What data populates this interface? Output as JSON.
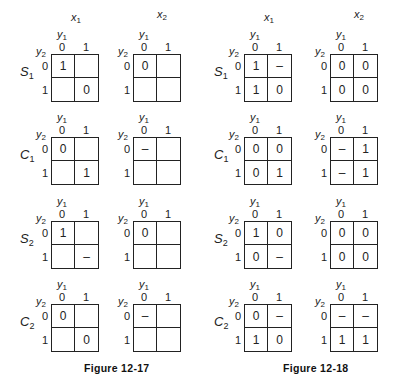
{
  "figures": [
    {
      "caption": "Figure 12-17",
      "column_headers": [
        {
          "var": "x",
          "sub": "1"
        },
        {
          "var": "x",
          "sub": "2"
        }
      ],
      "axis": {
        "col_var": "y",
        "col_sub": "1",
        "row_var": "y",
        "row_sub": "2",
        "col_values": [
          "0",
          "1"
        ],
        "row_values": [
          "0",
          "1"
        ]
      },
      "rows": [
        {
          "label": {
            "var": "S",
            "sub": "1"
          },
          "maps": [
            {
              "cells": [
                [
                  "1",
                  ""
                ],
                [
                  "",
                  "0"
                ]
              ]
            },
            {
              "cells": [
                [
                  "0",
                  ""
                ],
                [
                  "",
                  ""
                ]
              ]
            }
          ]
        },
        {
          "label": {
            "var": "C",
            "sub": "1"
          },
          "maps": [
            {
              "cells": [
                [
                  "0",
                  ""
                ],
                [
                  "",
                  "1"
                ]
              ]
            },
            {
              "cells": [
                [
                  "–",
                  ""
                ],
                [
                  "",
                  ""
                ]
              ]
            }
          ]
        },
        {
          "label": {
            "var": "S",
            "sub": "2"
          },
          "maps": [
            {
              "cells": [
                [
                  "1",
                  ""
                ],
                [
                  "",
                  "–"
                ]
              ]
            },
            {
              "cells": [
                [
                  "0",
                  ""
                ],
                [
                  "",
                  ""
                ]
              ]
            }
          ]
        },
        {
          "label": {
            "var": "C",
            "sub": "2"
          },
          "maps": [
            {
              "cells": [
                [
                  "0",
                  ""
                ],
                [
                  "",
                  "0"
                ]
              ]
            },
            {
              "cells": [
                [
                  "–",
                  ""
                ],
                [
                  "",
                  ""
                ]
              ]
            }
          ]
        }
      ]
    },
    {
      "caption": "Figure 12-18",
      "column_headers": [
        {
          "var": "x",
          "sub": "1"
        },
        {
          "var": "x",
          "sub": "2"
        }
      ],
      "axis": {
        "col_var": "y",
        "col_sub": "1",
        "row_var": "y",
        "row_sub": "2",
        "col_values": [
          "0",
          "1"
        ],
        "row_values": [
          "0",
          "1"
        ]
      },
      "rows": [
        {
          "label": {
            "var": "S",
            "sub": "1"
          },
          "maps": [
            {
              "cells": [
                [
                  "1",
                  "–"
                ],
                [
                  "1",
                  "0"
                ]
              ]
            },
            {
              "cells": [
                [
                  "0",
                  "0"
                ],
                [
                  "0",
                  "0"
                ]
              ]
            }
          ]
        },
        {
          "label": {
            "var": "C",
            "sub": "1"
          },
          "maps": [
            {
              "cells": [
                [
                  "0",
                  "0"
                ],
                [
                  "0",
                  "1"
                ]
              ]
            },
            {
              "cells": [
                [
                  "–",
                  "1"
                ],
                [
                  "–",
                  "1"
                ]
              ]
            }
          ]
        },
        {
          "label": {
            "var": "S",
            "sub": "2"
          },
          "maps": [
            {
              "cells": [
                [
                  "1",
                  "0"
                ],
                [
                  "0",
                  "–"
                ]
              ]
            },
            {
              "cells": [
                [
                  "0",
                  "0"
                ],
                [
                  "0",
                  "0"
                ]
              ]
            }
          ]
        },
        {
          "label": {
            "var": "C",
            "sub": "2"
          },
          "maps": [
            {
              "cells": [
                [
                  "0",
                  "–"
                ],
                [
                  "1",
                  "0"
                ]
              ]
            },
            {
              "cells": [
                [
                  "–",
                  "–"
                ],
                [
                  "1",
                  "1"
                ]
              ]
            }
          ]
        }
      ]
    }
  ]
}
